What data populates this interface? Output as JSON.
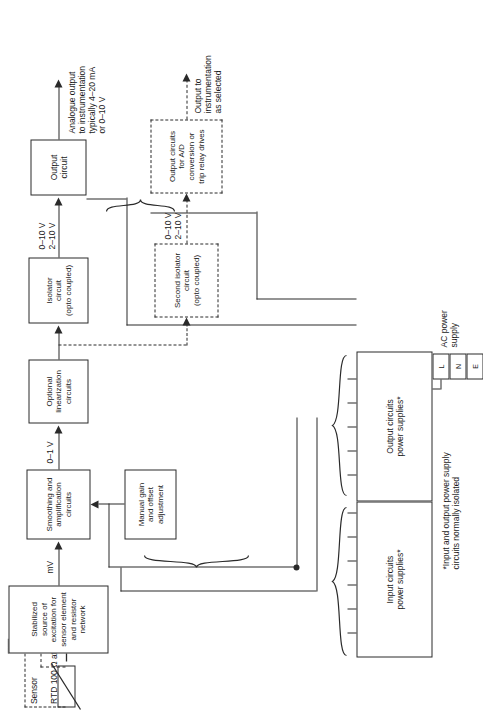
{
  "figure": {
    "domain": "block-diagram"
  },
  "sensor": {
    "label_line1": "Sensor",
    "label_line2": "RTD 100 Ω at 0°C"
  },
  "blocks": {
    "excitation": "Stabilized source of\nexcitation for\nsensor element\nand resistor network",
    "manual_gain": "Manual gain\nand offset\nadjustment",
    "smoothing": "Smoothing and\namplification\ncircuits",
    "linearization": "Optional\nlinearization\ncircuits",
    "isolator": "Isolator\ncircuit\n(opto coupled)",
    "output_circuit": "Output\ncircuit",
    "second_isolator": "Second isolator\ncircuit\n(opto coupled)",
    "output_circuits_ad": "Output circuits\nfor A/D\nconversion or\ntrip relay drives",
    "input_psu": "Input circuits\npower supplies*",
    "output_psu": "Output circuits\npower supplies*"
  },
  "signal_labels": {
    "mv": "mV",
    "zero_to_one_v": "0–1 V",
    "isolator_out": "0–10 V\n2–10 V",
    "second_isolator_in": "0–10 V\n2–10 V"
  },
  "annotations": {
    "analogue_output": "Analogue output\nto instrumentation\ntypically 4–20 mA\nor 0–10 V",
    "output_to_instrumentation": "Output to\ninstrumentation\nas selected",
    "footnote": "*Input and output power supply\ncircuits normally isolated"
  },
  "power": {
    "ac_supply": "AC power\nsupply",
    "terminals": [
      "L",
      "N",
      "E"
    ]
  }
}
